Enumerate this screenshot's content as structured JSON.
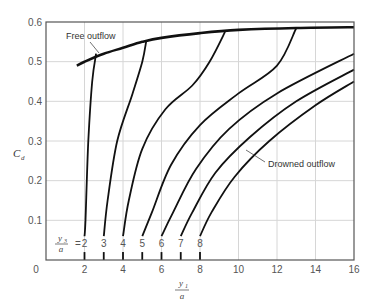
{
  "chart_data": {
    "type": "line",
    "title": "",
    "xlabel": "y1/a",
    "ylabel": "Cd",
    "xlim": [
      0,
      16
    ],
    "ylim": [
      0,
      0.6
    ],
    "grid": true,
    "x_ticks": [
      "0",
      "2",
      "4",
      "6",
      "8",
      "10",
      "12",
      "14",
      "16"
    ],
    "y_ticks": [
      "0.1",
      "0.2",
      "0.3",
      "0.4",
      "0.5",
      "0.6"
    ],
    "annotations": [
      "Free outflow",
      "Drowned outflow",
      "y3/a = 2, 3, 4, 5, 6, 7, 8"
    ],
    "series": [
      {
        "name": "Free outflow",
        "x": [
          1.6,
          2,
          3,
          4,
          5,
          6,
          8,
          10,
          13,
          16
        ],
        "y": [
          0.49,
          0.5,
          0.52,
          0.535,
          0.55,
          0.56,
          0.572,
          0.58,
          0.585,
          0.587
        ]
      },
      {
        "name": "y3/a = 2",
        "x": [
          2,
          2.05,
          2.2,
          2.4,
          2.6
        ],
        "y": [
          0.0,
          0.1,
          0.3,
          0.45,
          0.52
        ]
      },
      {
        "name": "y3/a = 3",
        "x": [
          3,
          3.2,
          3.7,
          4.5,
          5.0,
          5.2
        ],
        "y": [
          0.0,
          0.15,
          0.3,
          0.42,
          0.5,
          0.55
        ]
      },
      {
        "name": "y3/a = 4",
        "x": [
          4,
          4.3,
          5.0,
          6.2,
          7.6,
          8.5,
          9.3
        ],
        "y": [
          0.0,
          0.15,
          0.28,
          0.38,
          0.44,
          0.5,
          0.575
        ]
      },
      {
        "name": "y3/a = 5",
        "x": [
          5,
          5.5,
          6.5,
          8.0,
          10.0,
          12.0,
          13.0
        ],
        "y": [
          0.0,
          0.12,
          0.24,
          0.34,
          0.42,
          0.49,
          0.585
        ]
      },
      {
        "name": "y3/a = 6",
        "x": [
          6,
          6.6,
          7.8,
          9.5,
          12.0,
          16.0
        ],
        "y": [
          0.0,
          0.12,
          0.23,
          0.33,
          0.42,
          0.52
        ]
      },
      {
        "name": "y3/a = 7",
        "x": [
          7,
          7.6,
          8.8,
          10.6,
          13.0,
          16.0
        ],
        "y": [
          0.0,
          0.12,
          0.22,
          0.31,
          0.4,
          0.48
        ]
      },
      {
        "name": "y3/a = 8",
        "x": [
          8,
          8.6,
          9.8,
          11.6,
          14.0,
          16.0
        ],
        "y": [
          0.0,
          0.12,
          0.21,
          0.3,
          0.39,
          0.45
        ]
      }
    ]
  },
  "labels": {
    "free_outflow": "Free outflow",
    "drowned_outflow": "Drowned outflow",
    "ylabel_main": "C",
    "ylabel_sub": "d",
    "xlabel_num": "y",
    "xlabel_num_sub": "1",
    "xlabel_den": "a",
    "param_num": "y",
    "param_num_sub": "3",
    "param_den": "a",
    "param_eq": "=",
    "origin": "0"
  },
  "colors": {
    "curve": "#111111",
    "grid": "#d6d6d6",
    "axis": "#555555"
  }
}
